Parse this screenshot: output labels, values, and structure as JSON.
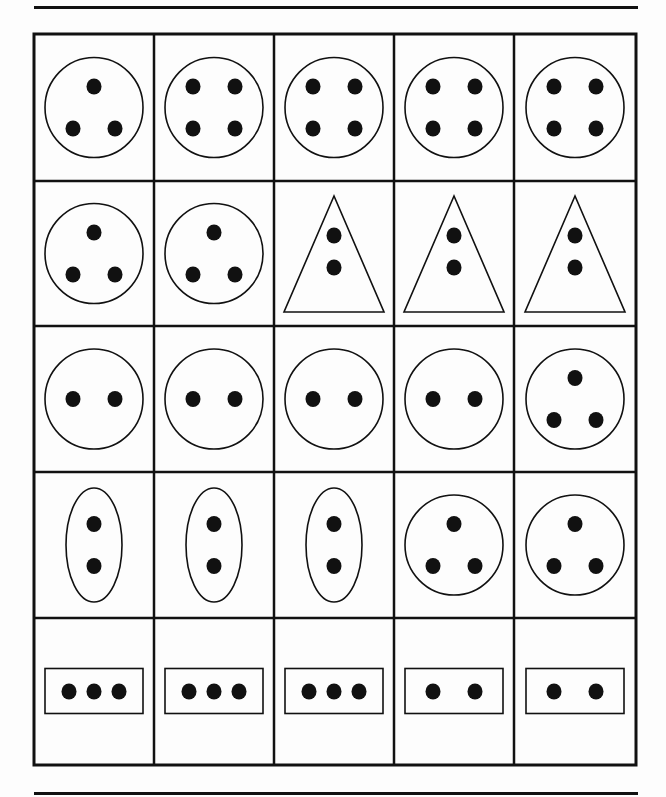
{
  "worksheet": {
    "rows": 5,
    "cols": 5,
    "line_color": "#111111",
    "cells": [
      [
        {
          "shape": "circle",
          "dots": 3,
          "arrangement": "triangle"
        },
        {
          "shape": "circle",
          "dots": 4,
          "arrangement": "square"
        },
        {
          "shape": "circle",
          "dots": 4,
          "arrangement": "square"
        },
        {
          "shape": "circle",
          "dots": 4,
          "arrangement": "square"
        },
        {
          "shape": "circle",
          "dots": 4,
          "arrangement": "square"
        }
      ],
      [
        {
          "shape": "circle",
          "dots": 3,
          "arrangement": "triangle"
        },
        {
          "shape": "circle",
          "dots": 3,
          "arrangement": "triangle"
        },
        {
          "shape": "triangle",
          "dots": 2,
          "arrangement": "vertical"
        },
        {
          "shape": "triangle",
          "dots": 2,
          "arrangement": "vertical"
        },
        {
          "shape": "triangle",
          "dots": 2,
          "arrangement": "vertical"
        }
      ],
      [
        {
          "shape": "circle",
          "dots": 2,
          "arrangement": "horizontal"
        },
        {
          "shape": "circle",
          "dots": 2,
          "arrangement": "horizontal"
        },
        {
          "shape": "circle",
          "dots": 2,
          "arrangement": "horizontal"
        },
        {
          "shape": "circle",
          "dots": 2,
          "arrangement": "horizontal"
        },
        {
          "shape": "circle",
          "dots": 3,
          "arrangement": "triangle"
        }
      ],
      [
        {
          "shape": "oval",
          "dots": 2,
          "arrangement": "vertical"
        },
        {
          "shape": "oval",
          "dots": 2,
          "arrangement": "vertical"
        },
        {
          "shape": "oval",
          "dots": 2,
          "arrangement": "vertical"
        },
        {
          "shape": "circle",
          "dots": 3,
          "arrangement": "triangle"
        },
        {
          "shape": "circle",
          "dots": 3,
          "arrangement": "triangle"
        }
      ],
      [
        {
          "shape": "rectangle",
          "dots": 3,
          "arrangement": "horizontal"
        },
        {
          "shape": "rectangle",
          "dots": 3,
          "arrangement": "horizontal"
        },
        {
          "shape": "rectangle",
          "dots": 3,
          "arrangement": "horizontal"
        },
        {
          "shape": "rectangle",
          "dots": 2,
          "arrangement": "horizontal"
        },
        {
          "shape": "rectangle",
          "dots": 2,
          "arrangement": "horizontal"
        }
      ]
    ]
  }
}
